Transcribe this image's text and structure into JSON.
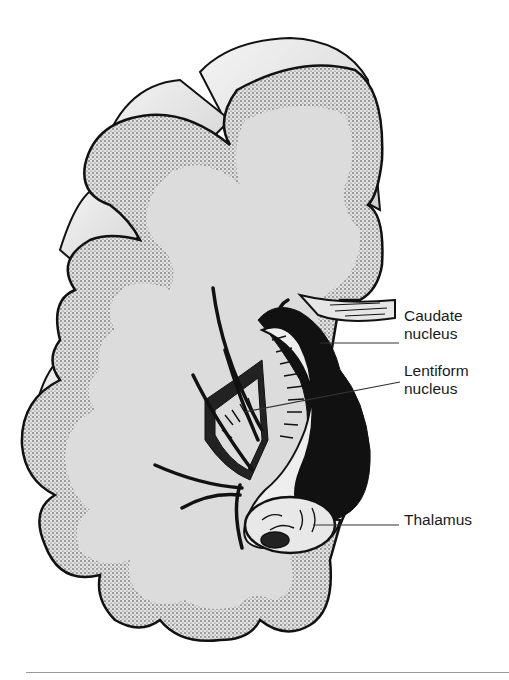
{
  "figure": {
    "labels": [
      {
        "id": "caudate",
        "text": "Caudate\nnucleus",
        "x": 404,
        "y": 307
      },
      {
        "id": "lentiform",
        "text": "Lentiform\nnucleus",
        "x": 404,
        "y": 362
      },
      {
        "id": "thalamus",
        "text": "Thalamus",
        "x": 404,
        "y": 511
      }
    ],
    "colors": {
      "ink": "#111111",
      "fill": "#dedede",
      "cortex_stipple": "#c8c8c8",
      "rule": "#9a9a9a"
    }
  }
}
